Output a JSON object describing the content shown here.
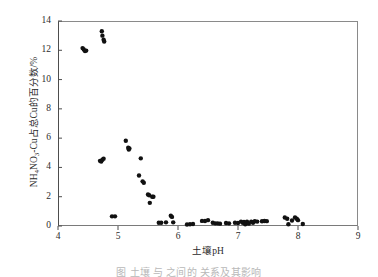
{
  "chart_data": {
    "type": "scatter",
    "title": "",
    "subtitle": "",
    "xlabel": "土壤pH",
    "ylabel_plain": "NH4NO3-Cu占总Cu的百分数/%",
    "ylabel_prefix": "NH",
    "ylabel_sub1": "4",
    "ylabel_mid": "NO",
    "ylabel_sub2": "3",
    "ylabel_suffix": "-Cu占总Cu的百分数/%",
    "xlim": [
      4,
      9
    ],
    "ylim": [
      0,
      14
    ],
    "xticks": [
      4,
      5,
      6,
      7,
      8,
      9
    ],
    "yticks": [
      0,
      2,
      4,
      6,
      8,
      10,
      12,
      14
    ],
    "xtick_labels": [
      "4",
      "5",
      "6",
      "7",
      "8",
      "9"
    ],
    "ytick_labels": [
      "0",
      "2",
      "4",
      "6",
      "8",
      "10",
      "12",
      "14"
    ],
    "grid": false,
    "legend": null,
    "marker": {
      "shape": "circle",
      "color": "#111111",
      "size_px": 4.4,
      "filled": true
    },
    "axis_color": "#4d4d4d",
    "background": "#ffffff",
    "series": [
      {
        "name": "NH4NO3-Cu percentage of total Cu",
        "points": [
          [
            4.41,
            12.15
          ],
          [
            4.43,
            12.05
          ],
          [
            4.45,
            11.95
          ],
          [
            4.47,
            11.98
          ],
          [
            4.73,
            13.3
          ],
          [
            4.74,
            13.0
          ],
          [
            4.76,
            12.72
          ],
          [
            4.77,
            12.6
          ],
          [
            4.7,
            4.45
          ],
          [
            4.72,
            4.4
          ],
          [
            4.74,
            4.52
          ],
          [
            4.76,
            4.6
          ],
          [
            4.9,
            0.66
          ],
          [
            4.95,
            0.66
          ],
          [
            5.13,
            5.82
          ],
          [
            5.17,
            5.35
          ],
          [
            5.18,
            5.22
          ],
          [
            5.19,
            5.3
          ],
          [
            5.38,
            4.62
          ],
          [
            5.35,
            3.45
          ],
          [
            5.41,
            3.05
          ],
          [
            5.43,
            2.95
          ],
          [
            5.5,
            2.15
          ],
          [
            5.52,
            2.1
          ],
          [
            5.53,
            1.58
          ],
          [
            5.57,
            2.0
          ],
          [
            5.59,
            2.0
          ],
          [
            5.68,
            0.22
          ],
          [
            5.72,
            0.22
          ],
          [
            5.8,
            0.25
          ],
          [
            5.88,
            0.7
          ],
          [
            5.9,
            0.62
          ],
          [
            5.92,
            0.25
          ],
          [
            6.15,
            0.1
          ],
          [
            6.2,
            0.12
          ],
          [
            6.25,
            0.14
          ],
          [
            6.4,
            0.35
          ],
          [
            6.45,
            0.34
          ],
          [
            6.5,
            0.4
          ],
          [
            6.58,
            0.22
          ],
          [
            6.62,
            0.18
          ],
          [
            6.66,
            0.18
          ],
          [
            6.7,
            0.16
          ],
          [
            6.8,
            0.2
          ],
          [
            6.85,
            0.18
          ],
          [
            6.95,
            0.22
          ],
          [
            7.0,
            0.2
          ],
          [
            7.05,
            0.3
          ],
          [
            7.08,
            0.22
          ],
          [
            7.1,
            0.28
          ],
          [
            7.12,
            0.12
          ],
          [
            7.15,
            0.3
          ],
          [
            7.18,
            0.16
          ],
          [
            7.22,
            0.3
          ],
          [
            7.25,
            0.22
          ],
          [
            7.28,
            0.32
          ],
          [
            7.32,
            0.3
          ],
          [
            7.4,
            0.32
          ],
          [
            7.44,
            0.34
          ],
          [
            7.48,
            0.33
          ],
          [
            7.78,
            0.58
          ],
          [
            7.82,
            0.5
          ],
          [
            7.84,
            0.12
          ],
          [
            7.9,
            0.38
          ],
          [
            7.95,
            0.58
          ],
          [
            7.98,
            0.5
          ],
          [
            8.0,
            0.4
          ],
          [
            8.08,
            0.14
          ]
        ]
      }
    ]
  },
  "caption": {
    "text": "图     土壤    与                 之间的    关系及其影响"
  }
}
